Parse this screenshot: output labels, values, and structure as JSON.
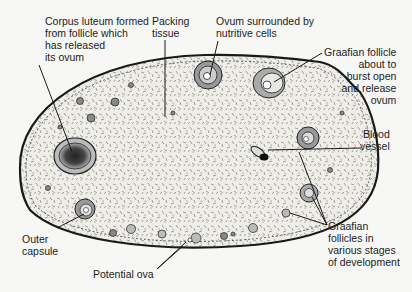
{
  "diagram": {
    "labels": {
      "corpus_luteum": "Corpus luteum formed\nfrom follicle which\nhas released\nits ovum",
      "packing_tissue": "Packing\ntissue",
      "ovum_nutritive": "Ovum surrounded by\nnutritive cells",
      "graafian_burst": "Graafian follicle\nabout to\nburst open\nand release\novum",
      "blood_vessel": "Blood\nvessel",
      "graafian_stages": "Graafian\nfollicles in\nvarious stages\nof development",
      "outer_capsule": "Outer\ncapsule",
      "potential_ova": "Potential ova"
    },
    "colors": {
      "ink": "#1a1a1a",
      "tissue": "#ecebe6",
      "background": "#f7f7f5"
    }
  }
}
